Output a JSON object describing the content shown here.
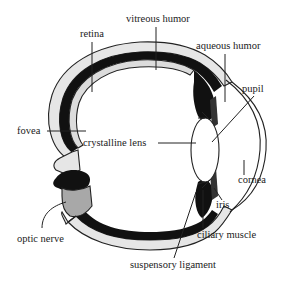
{
  "diagram": {
    "labels": {
      "vitreous_humor": "vitreous humor",
      "retina": "retina",
      "aqueous_humor": "aqueous humor",
      "pupil": "pupil",
      "fovea": "fovea",
      "crystalline_lens": "crystalline lens",
      "cornea": "cornea",
      "iris": "iris",
      "optic_nerve": "optic nerve",
      "ciliary_muscle": "ciliary muscle",
      "suspensory_ligament": "suspensory ligament"
    },
    "colors": {
      "sclera": "#e6e6e6",
      "choroid": "#111111",
      "optic_nerve": "#a8a8a8",
      "outline": "#222222",
      "background": "#ffffff"
    }
  }
}
